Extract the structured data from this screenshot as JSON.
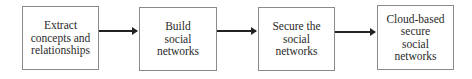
{
  "diagram": {
    "type": "flowchart",
    "direction": "left-to-right",
    "nodes": [
      {
        "id": "n1",
        "label": "Extract\nconcepts and\nrelationships"
      },
      {
        "id": "n2",
        "label": "Build\nsocial\nnetworks"
      },
      {
        "id": "n3",
        "label": "Secure the\nsocial\nnetworks"
      },
      {
        "id": "n4",
        "label": "Cloud-based\nsecure\nsocial\nnetworks"
      }
    ],
    "edges": [
      {
        "from": "n1",
        "to": "n2"
      },
      {
        "from": "n2",
        "to": "n3"
      },
      {
        "from": "n3",
        "to": "n4"
      }
    ]
  }
}
